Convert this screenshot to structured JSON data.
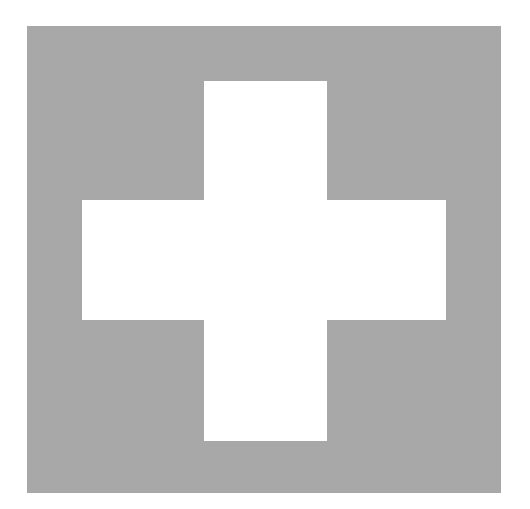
{
  "image": {
    "subject": "white cross on gray square",
    "icon": "cross-icon",
    "colors": {
      "background": "#ffffff",
      "square": "#a8a8a8",
      "cross": "#ffffff"
    }
  }
}
